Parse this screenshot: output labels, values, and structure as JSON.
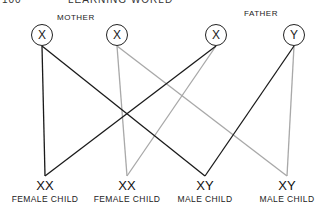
{
  "header": {
    "page_number": "100",
    "running_title": "LEARNING WORLD"
  },
  "parents": {
    "mother": {
      "label": "MOTHER",
      "chromosomes": [
        {
          "id": "m1",
          "symbol": "X",
          "cx": 42,
          "cy": 35
        },
        {
          "id": "m2",
          "symbol": "X",
          "cx": 117,
          "cy": 35
        }
      ]
    },
    "father": {
      "label": "FATHER",
      "chromosomes": [
        {
          "id": "f1",
          "symbol": "X",
          "cx": 216,
          "cy": 35
        },
        {
          "id": "f2",
          "symbol": "Y",
          "cx": 294,
          "cy": 35
        }
      ]
    }
  },
  "children": [
    {
      "genotype": "XX",
      "label": "FEMALE CHILD",
      "cx": 45,
      "cy": 172
    },
    {
      "genotype": "XX",
      "label": "FEMALE CHILD",
      "cx": 127,
      "cy": 172
    },
    {
      "genotype": "XY",
      "label": "MALE CHILD",
      "cx": 205,
      "cy": 172
    },
    {
      "genotype": "XY",
      "label": "MALE CHILD",
      "cx": 287,
      "cy": 172
    }
  ],
  "links": [
    {
      "from": "m1",
      "to": 0,
      "color": "#1a1a1a"
    },
    {
      "from": "m1",
      "to": 2,
      "color": "#1a1a1a"
    },
    {
      "from": "f1",
      "to": 0,
      "color": "#1a1a1a"
    },
    {
      "from": "f2",
      "to": 2,
      "color": "#1a1a1a"
    },
    {
      "from": "m2",
      "to": 1,
      "color": "#a8a8a8"
    },
    {
      "from": "m2",
      "to": 3,
      "color": "#a8a8a8"
    },
    {
      "from": "f1",
      "to": 1,
      "color": "#a8a8a8"
    },
    {
      "from": "f2",
      "to": 3,
      "color": "#a8a8a8"
    }
  ],
  "colors": {
    "dark_line": "#1a1a1a",
    "light_line": "#a8a8a8"
  }
}
